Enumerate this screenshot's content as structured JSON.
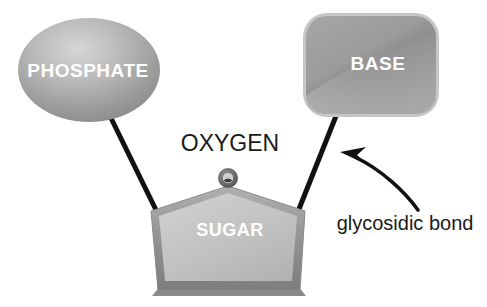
{
  "diagram": {
    "background_color": "#ffffff",
    "nodes": {
      "phosphate": {
        "label": "PHOSPHATE",
        "shape": "ellipse",
        "fill_color": "#9e9e9e",
        "text_color": "#ffffff"
      },
      "base": {
        "label": "BASE",
        "shape": "rounded-rectangle",
        "fill_color": "#9a9a9a",
        "text_color": "#ffffff"
      },
      "sugar": {
        "label": "SUGAR",
        "shape": "pentagon",
        "fill_color": "#c3c3c3",
        "edge_color": "#8a8a8a",
        "text_color": "#ffffff"
      },
      "oxygen": {
        "label": "OXYGEN",
        "shape": "circle",
        "fill_color": "#6e6e6e",
        "text_color": "#1a1a1a"
      }
    },
    "annotations": {
      "glycosidic_bond": {
        "label": "glycosidic bond",
        "text_color": "#1a1a1a",
        "arrow_color": "#111111"
      }
    },
    "bonds": {
      "phosphate_to_sugar": {
        "name": "phosphoester bond line",
        "color": "#111111"
      },
      "base_to_sugar": {
        "name": "glycosidic bond line",
        "color": "#111111"
      }
    }
  }
}
